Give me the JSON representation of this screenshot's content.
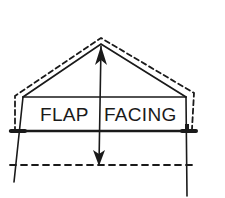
{
  "diagram": {
    "type": "sewing-pattern-piece",
    "labels": {
      "left": "FLAP",
      "right": "FACING"
    },
    "colors": {
      "ink": "#1a1a1a",
      "background": "#ffffff"
    },
    "elements": [
      "triangular-flap-outline",
      "dashed-seam-allowance-outline",
      "rectangular-label-band",
      "fold-line",
      "dashed-placement-line",
      "grainline-double-arrow"
    ]
  }
}
